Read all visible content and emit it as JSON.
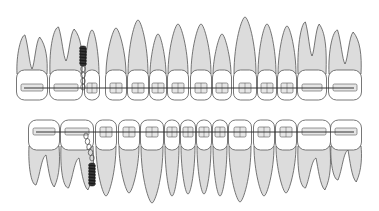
{
  "figure": {
    "title": "Orthodontic braces with mini-screw anchorage"
  },
  "colors": {
    "root_fill": "#dcdcdc",
    "crown_fill": "#ffffff",
    "outline": "#555555",
    "wire": "#333333",
    "screw": "#333333"
  },
  "upper_arch": {
    "teeth": [
      {
        "x": 16,
        "w": 32,
        "type": "molar",
        "tip": 35
      },
      {
        "x": 49,
        "w": 34,
        "type": "molar",
        "tip": 27
      },
      {
        "x": 84,
        "w": 16,
        "type": "premolar",
        "tip": 30
      },
      {
        "x": 105,
        "w": 22,
        "type": "premolar",
        "tip": 28
      },
      {
        "x": 127,
        "w": 22,
        "type": "canine",
        "tip": 20
      },
      {
        "x": 149,
        "w": 18,
        "type": "incisor",
        "tip": 34
      },
      {
        "x": 167,
        "w": 22,
        "type": "incisor",
        "tip": 24
      },
      {
        "x": 190,
        "w": 22,
        "type": "incisor",
        "tip": 24
      },
      {
        "x": 212,
        "w": 20,
        "type": "incisor",
        "tip": 34
      },
      {
        "x": 233,
        "w": 24,
        "type": "canine",
        "tip": 17
      },
      {
        "x": 257,
        "w": 20,
        "type": "premolar",
        "tip": 24
      },
      {
        "x": 277,
        "w": 20,
        "type": "premolar",
        "tip": 26
      },
      {
        "x": 297,
        "w": 30,
        "type": "molar",
        "tip": 22
      },
      {
        "x": 328,
        "w": 34,
        "type": "molar",
        "tip": 30
      }
    ],
    "wire_y": 88,
    "mini_screw": {
      "x": 83,
      "y_top": 46,
      "y_bottom": 66
    }
  },
  "lower_arch": {
    "teeth": [
      {
        "x": 28,
        "w": 32,
        "type": "molar",
        "tip": 185
      },
      {
        "x": 60,
        "w": 34,
        "type": "molar",
        "tip": 188
      },
      {
        "x": 95,
        "w": 22,
        "type": "premolar",
        "tip": 196
      },
      {
        "x": 118,
        "w": 22,
        "type": "premolar",
        "tip": 193
      },
      {
        "x": 140,
        "w": 24,
        "type": "canine",
        "tip": 203
      },
      {
        "x": 164,
        "w": 16,
        "type": "incisor",
        "tip": 196
      },
      {
        "x": 180,
        "w": 16,
        "type": "incisor",
        "tip": 194
      },
      {
        "x": 196,
        "w": 16,
        "type": "incisor",
        "tip": 194
      },
      {
        "x": 212,
        "w": 16,
        "type": "incisor",
        "tip": 196
      },
      {
        "x": 228,
        "w": 24,
        "type": "canine",
        "tip": 202
      },
      {
        "x": 253,
        "w": 22,
        "type": "premolar",
        "tip": 196
      },
      {
        "x": 275,
        "w": 22,
        "type": "premolar",
        "tip": 193
      },
      {
        "x": 297,
        "w": 34,
        "type": "molar",
        "tip": 188
      },
      {
        "x": 330,
        "w": 32,
        "type": "molar",
        "tip": 180
      }
    ],
    "wire_y": 132,
    "mini_screw": {
      "x": 92,
      "y_top": 163,
      "y_bottom": 186
    }
  }
}
